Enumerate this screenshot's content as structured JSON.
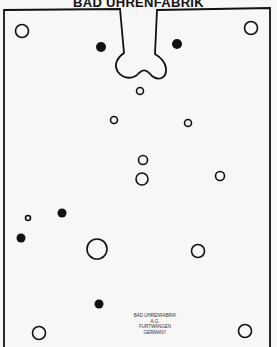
{
  "title": "BAD UHRENFABRIK",
  "stamp": {
    "line1": "BAD UHRENFABRIK",
    "line2": "A.G.",
    "line3": "FURTWANGEN",
    "line4": "GERMANY"
  },
  "colors": {
    "ink": "#111111",
    "paper": "#f7f7f5"
  },
  "holes": {
    "open": [
      {
        "x": 22,
        "y": 31,
        "r": 6.5
      },
      {
        "x": 251,
        "y": 28,
        "r": 6.5
      },
      {
        "x": 140,
        "y": 91,
        "r": 3.5
      },
      {
        "x": 114,
        "y": 120,
        "r": 3.5
      },
      {
        "x": 188,
        "y": 123,
        "r": 3.5
      },
      {
        "x": 143,
        "y": 160,
        "r": 4.5
      },
      {
        "x": 142,
        "y": 179,
        "r": 6
      },
      {
        "x": 220,
        "y": 176,
        "r": 4.5
      },
      {
        "x": 28,
        "y": 218,
        "r": 2.5
      },
      {
        "x": 97,
        "y": 249,
        "r": 10
      },
      {
        "x": 198,
        "y": 251,
        "r": 6.5
      },
      {
        "x": 39,
        "y": 333,
        "r": 6.5
      },
      {
        "x": 245,
        "y": 331,
        "r": 6.5
      }
    ],
    "filled": [
      {
        "x": 101,
        "y": 47,
        "r": 5
      },
      {
        "x": 177,
        "y": 44,
        "r": 5
      },
      {
        "x": 62,
        "y": 213,
        "r": 4.5
      },
      {
        "x": 21,
        "y": 238,
        "r": 4.5
      },
      {
        "x": 99,
        "y": 304,
        "r": 4.5
      }
    ]
  }
}
